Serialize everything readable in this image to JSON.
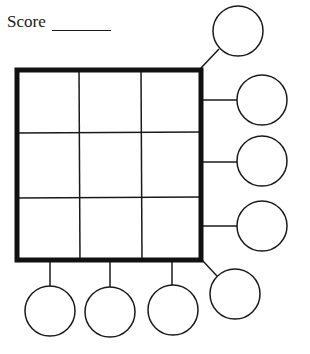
{
  "worksheet": {
    "score_label": "Score",
    "score_value": ""
  },
  "grid": {
    "rows": 3,
    "cols": 3,
    "cells": [
      "",
      "",
      "",
      "",
      "",
      "",
      "",
      "",
      ""
    ]
  },
  "answer_circles": [
    {
      "id": "diag-top-right",
      "value": ""
    },
    {
      "id": "row-1",
      "value": ""
    },
    {
      "id": "row-2",
      "value": ""
    },
    {
      "id": "row-3",
      "value": ""
    },
    {
      "id": "diag-bottom-right",
      "value": ""
    },
    {
      "id": "col-1",
      "value": ""
    },
    {
      "id": "col-2",
      "value": ""
    },
    {
      "id": "col-3",
      "value": ""
    }
  ],
  "colors": {
    "ink": "#1a1a1a",
    "background": "#ffffff"
  }
}
